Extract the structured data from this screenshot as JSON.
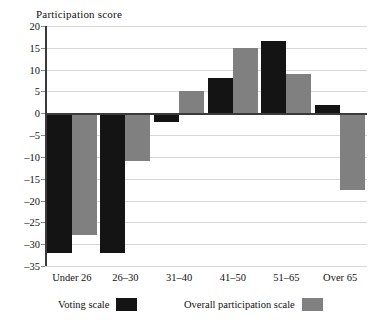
{
  "chart_data": {
    "type": "bar",
    "title": "Participation score",
    "xlabel": "",
    "ylabel": "",
    "ylim": [
      -35,
      20
    ],
    "ytick_step": 5,
    "yticks": [
      "20",
      "15",
      "10",
      "5",
      "0",
      "–5",
      "–10",
      "–15",
      "–20",
      "–25",
      "–30",
      "–35"
    ],
    "ytick_values": [
      20,
      15,
      10,
      5,
      0,
      -5,
      -10,
      -15,
      -20,
      -25,
      -30,
      -35
    ],
    "grid": true,
    "legend_position": "bottom",
    "categories": [
      "Under 26",
      "26–30",
      "31–40",
      "41–50",
      "51–65",
      "Over 65"
    ],
    "series": [
      {
        "name": "Voting scale",
        "color": "#141414",
        "values": [
          -32,
          -32,
          -2,
          8,
          16.5,
          2
        ]
      },
      {
        "name": "Overall participation scale",
        "color": "#808080",
        "values": [
          -28,
          -11,
          5,
          15,
          9,
          -17.5
        ]
      }
    ]
  }
}
